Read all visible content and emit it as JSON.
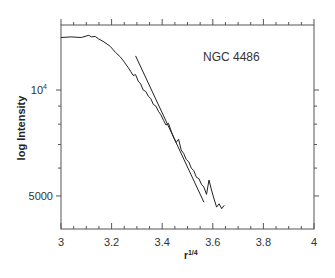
{
  "chart_data": {
    "type": "line",
    "title": "",
    "annotation": "NGC 4486",
    "xlabel": "r",
    "xlabel_superscript": "1/4",
    "ylabel": "log Intensity",
    "xlim": [
      3,
      4
    ],
    "ylim_log": [
      4100,
      15000
    ],
    "yscale": "log",
    "grid": false,
    "legend": "none",
    "x_ticks": [
      3,
      3.2,
      3.4,
      3.6,
      3.8,
      4
    ],
    "x_tick_labels": [
      "3",
      "3.2",
      "3.4",
      "3.6",
      "3.8",
      "4"
    ],
    "y_ticks": [
      5000,
      6000,
      7000,
      8000,
      9000,
      10000
    ],
    "y_tick_labels": [
      {
        "value": 10000,
        "base": "10",
        "exp": "4"
      },
      {
        "value": 5000,
        "text": "5000"
      }
    ],
    "series": [
      {
        "name": "observed profile",
        "x": [
          3.0,
          3.04,
          3.08,
          3.11,
          3.12,
          3.135,
          3.15,
          3.17,
          3.195,
          3.215,
          3.235,
          3.25,
          3.265,
          3.275,
          3.285,
          3.295,
          3.305,
          3.315,
          3.325,
          3.335,
          3.345,
          3.355,
          3.365,
          3.375,
          3.385,
          3.395,
          3.405,
          3.415,
          3.425,
          3.435,
          3.445,
          3.455,
          3.465,
          3.475,
          3.485,
          3.495,
          3.505,
          3.515,
          3.525,
          3.535,
          3.545,
          3.555,
          3.565,
          3.575,
          3.585,
          3.595,
          3.605,
          3.615,
          3.625,
          3.635,
          3.645
        ],
        "y": [
          14100,
          14150,
          14100,
          14300,
          14150,
          14200,
          13950,
          13700,
          13300,
          12800,
          12400,
          12000,
          11600,
          11300,
          11000,
          11050,
          10600,
          10400,
          10000,
          9900,
          9600,
          9450,
          9100,
          9000,
          8700,
          8500,
          8200,
          7950,
          8050,
          7650,
          7350,
          7100,
          7250,
          6750,
          6600,
          6350,
          6250,
          6000,
          5900,
          5650,
          5600,
          5400,
          5300,
          5050,
          5550,
          5200,
          4900,
          4650,
          4750,
          4600,
          4700
        ]
      },
      {
        "name": "r^1/4 law fit",
        "x": [
          3.295,
          3.565
        ],
        "y": [
          12500,
          4800
        ]
      }
    ]
  }
}
